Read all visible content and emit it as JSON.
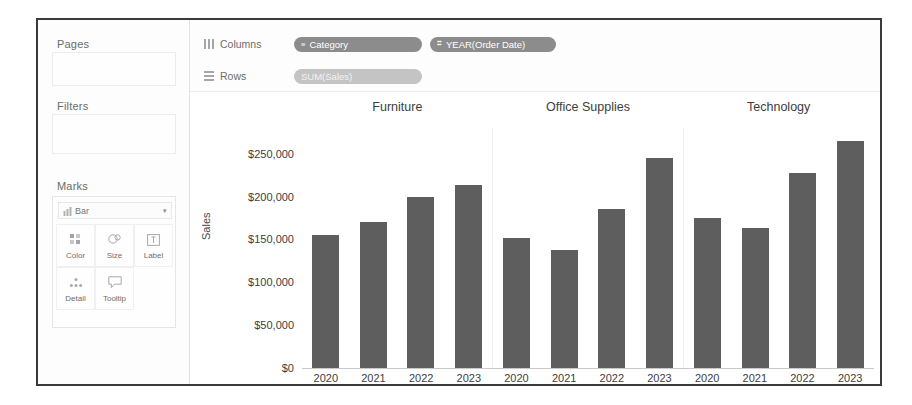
{
  "sidebar": {
    "pages_label": "Pages",
    "filters_label": "Filters",
    "marks_label": "Marks",
    "marks_type": "Bar",
    "marks_type_icon": "bar-mark-icon",
    "marks_chevron": "▾",
    "marks_buttons": [
      {
        "label": "Color",
        "icon": "color-palette-icon"
      },
      {
        "label": "Size",
        "icon": "size-circles-icon"
      },
      {
        "label": "Label",
        "icon": "label-box-icon"
      },
      {
        "label": "Detail",
        "icon": "detail-dots-icon"
      },
      {
        "label": "Tooltip",
        "icon": "tooltip-bubble-icon"
      }
    ]
  },
  "shelves": {
    "columns": {
      "name": "Columns",
      "icon": "columns-icon",
      "pills": [
        {
          "text": "Category",
          "icon": "≡",
          "kind": "dimension"
        },
        {
          "text": "YEAR(Order Date)",
          "icon": "⌗",
          "kind": "dimension"
        }
      ]
    },
    "rows": {
      "name": "Rows",
      "icon": "rows-icon",
      "pills": [
        {
          "text": "SUM(Sales)",
          "icon": "",
          "kind": "measure"
        }
      ]
    }
  },
  "chart_data": {
    "type": "bar",
    "title": "",
    "xlabel": "",
    "ylabel": "Sales",
    "ylim": [
      0,
      280000
    ],
    "yticks": [
      0,
      50000,
      100000,
      150000,
      200000,
      250000
    ],
    "ytick_labels": [
      "$0",
      "$50,000",
      "$100,000",
      "$150,000",
      "$200,000",
      "$250,000"
    ],
    "grid": false,
    "legend": "none",
    "categories": [
      "2020",
      "2021",
      "2022",
      "2023"
    ],
    "panels": [
      {
        "name": "Furniture",
        "values": [
          155000,
          170000,
          200000,
          213000
        ]
      },
      {
        "name": "Office Supplies",
        "values": [
          152000,
          138000,
          185000,
          245000
        ]
      },
      {
        "name": "Technology",
        "values": [
          175000,
          163000,
          227000,
          265000
        ]
      }
    ],
    "bar_color": "#5e5e5e"
  }
}
